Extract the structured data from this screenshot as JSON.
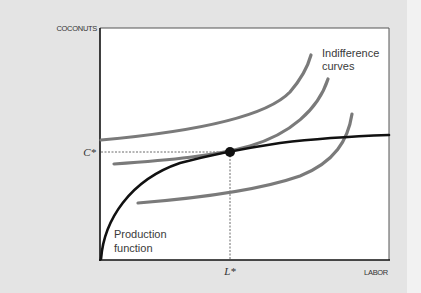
{
  "diagram": {
    "title": "",
    "y_axis_label": "COCONUTS",
    "x_axis_label": "LABOR",
    "y_equilibrium_label": "C*",
    "x_equilibrium_label": "L*",
    "annotations": {
      "indifference_line1": "Indifference",
      "indifference_line2": "curves",
      "production_line1": "Production",
      "production_line2": "function"
    },
    "colors": {
      "indifference_curves": "#7a7a7a",
      "production_function": "#111111",
      "background": "#e6e6e6",
      "plot_area": "#ffffff",
      "equilibrium_point": "#111111"
    },
    "curves": [
      {
        "name": "indifference-curve-high",
        "type": "indifference"
      },
      {
        "name": "indifference-curve-tangent",
        "type": "indifference"
      },
      {
        "name": "indifference-curve-low",
        "type": "indifference"
      },
      {
        "name": "production-function",
        "type": "production"
      }
    ],
    "equilibrium": {
      "label_x": "L*",
      "label_y": "C*"
    }
  }
}
